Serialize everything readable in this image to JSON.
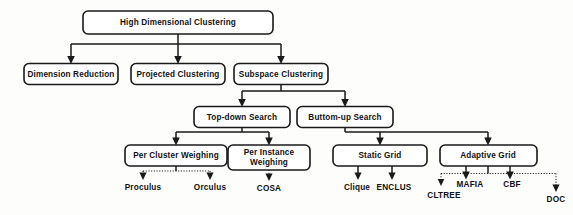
{
  "diagram": {
    "type": "tree-hierarchy-flowchart",
    "background_color": "#fdfdfc",
    "line_color": "#1a1a1a",
    "box_fill": "#ffffff",
    "text_color": "#111111",
    "nodes": {
      "root": {
        "label": "High Dimensional Clustering"
      },
      "level2": [
        {
          "label": "Dimension Reduction"
        },
        {
          "label": "Projected Clustering"
        },
        {
          "label": "Subspace Clustering"
        }
      ],
      "level3": [
        {
          "label": "Top-down Search"
        },
        {
          "label": "Buttom-up Search"
        }
      ],
      "level4": [
        {
          "label_line1": "Per Cluster Weighing",
          "label_line2": ""
        },
        {
          "label_line1": "Per Instance",
          "label_line2": "Weighing"
        },
        {
          "label_line1": "Static Grid",
          "label_line2": ""
        },
        {
          "label_line1": "Adaptive Grid",
          "label_line2": ""
        }
      ],
      "leaves": [
        {
          "label": "Proculus"
        },
        {
          "label": "Orculus"
        },
        {
          "label": "COSA"
        },
        {
          "label": "Clique"
        },
        {
          "label": "ENCLUS"
        },
        {
          "label": "CLTREE"
        },
        {
          "label": "MAFIA"
        },
        {
          "label": "CBF"
        },
        {
          "label": "DOC"
        }
      ]
    },
    "edges": [
      {
        "from": "High Dimensional Clustering",
        "to": "Dimension Reduction",
        "style": "solid-arrow"
      },
      {
        "from": "High Dimensional Clustering",
        "to": "Projected Clustering",
        "style": "solid-arrow"
      },
      {
        "from": "High Dimensional Clustering",
        "to": "Subspace Clustering",
        "style": "solid-arrow"
      },
      {
        "from": "Subspace Clustering",
        "to": "Top-down Search",
        "style": "solid-arrow"
      },
      {
        "from": "Subspace Clustering",
        "to": "Buttom-up Search",
        "style": "solid-arrow"
      },
      {
        "from": "Top-down Search",
        "to": "Per Cluster Weighing",
        "style": "solid-arrow"
      },
      {
        "from": "Top-down Search",
        "to": "Per Instance Weighing",
        "style": "solid-arrow"
      },
      {
        "from": "Buttom-up Search",
        "to": "Static Grid",
        "style": "solid-arrow"
      },
      {
        "from": "Buttom-up Search",
        "to": "Adaptive Grid",
        "style": "solid-arrow"
      },
      {
        "from": "Per Cluster Weighing",
        "to": "Proculus",
        "style": "dotted-arrow"
      },
      {
        "from": "Per Cluster Weighing",
        "to": "Orculus",
        "style": "dotted-arrow"
      },
      {
        "from": "Per Instance Weighing",
        "to": "COSA",
        "style": "dotted-arrow"
      },
      {
        "from": "Static Grid",
        "to": "Clique",
        "style": "solid-arrow"
      },
      {
        "from": "Static Grid",
        "to": "ENCLUS",
        "style": "solid-arrow"
      },
      {
        "from": "Adaptive Grid",
        "to": "CLTREE",
        "style": "dotted-arrow"
      },
      {
        "from": "Adaptive Grid",
        "to": "MAFIA",
        "style": "dotted-arrow"
      },
      {
        "from": "Adaptive Grid",
        "to": "CBF",
        "style": "dotted-arrow"
      },
      {
        "from": "Adaptive Grid",
        "to": "DOC",
        "style": "dotted-arrow"
      }
    ]
  }
}
